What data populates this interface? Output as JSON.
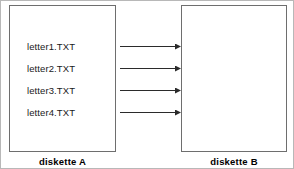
{
  "diagram": {
    "title_visible": false,
    "colors": {
      "frame_border": "#b8b8b8",
      "box_border": "#6e6e6e",
      "text": "#1a1a1a",
      "caption": "#000000",
      "arrow": "#2b2b2b",
      "background": "#ffffff"
    },
    "source": {
      "caption": "diskette A",
      "files": [
        {
          "name": "letter1.TXT"
        },
        {
          "name": "letter2.TXT"
        },
        {
          "name": "letter3.TXT"
        },
        {
          "name": "letter4.TXT"
        }
      ]
    },
    "destination": {
      "caption": "diskette B",
      "files": []
    },
    "arrows": [
      {
        "label": "",
        "from": "letter1.TXT",
        "direction": "right"
      },
      {
        "label": "",
        "from": "letter2.TXT",
        "direction": "right"
      },
      {
        "label": "",
        "from": "letter3.TXT",
        "direction": "right"
      },
      {
        "label": "",
        "from": "letter4.TXT",
        "direction": "right"
      }
    ]
  }
}
